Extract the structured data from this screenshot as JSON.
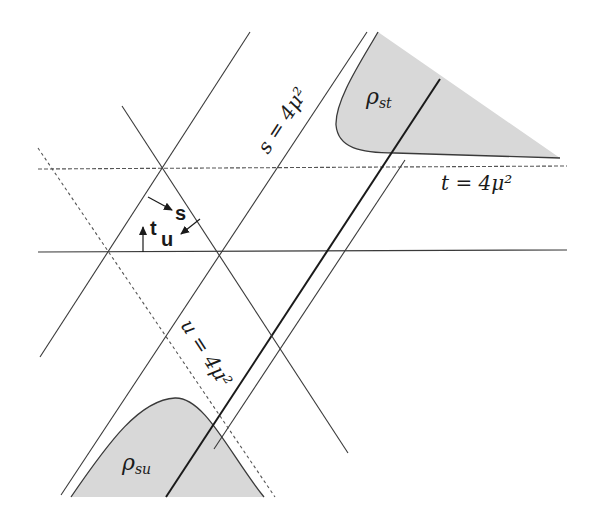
{
  "diagram": {
    "colors": {
      "line": "#3a3a3a",
      "dashed": "#555555",
      "shade": "#d8d8d8",
      "text": "#1a1a1a"
    },
    "labels": {
      "s_threshold": "s = 4μ²",
      "t_threshold": "t = 4μ²",
      "u_threshold": "u = 4μ²",
      "rho_st_symbol": "ρ",
      "rho_st_sub": "st",
      "rho_su_symbol": "ρ",
      "rho_su_sub": "su",
      "arrow_s": "s",
      "arrow_t": "t",
      "arrow_u": "u"
    },
    "regions": [
      {
        "name": "rho-st",
        "label": "ρ_st",
        "position": "upper-right"
      },
      {
        "name": "rho-su",
        "label": "ρ_su",
        "position": "lower-left"
      }
    ],
    "lines": {
      "solid": [
        "s=0",
        "t=0",
        "u=0",
        "s=4μ²"
      ],
      "dashed": [
        "t=4μ²",
        "u=4μ²"
      ]
    }
  }
}
